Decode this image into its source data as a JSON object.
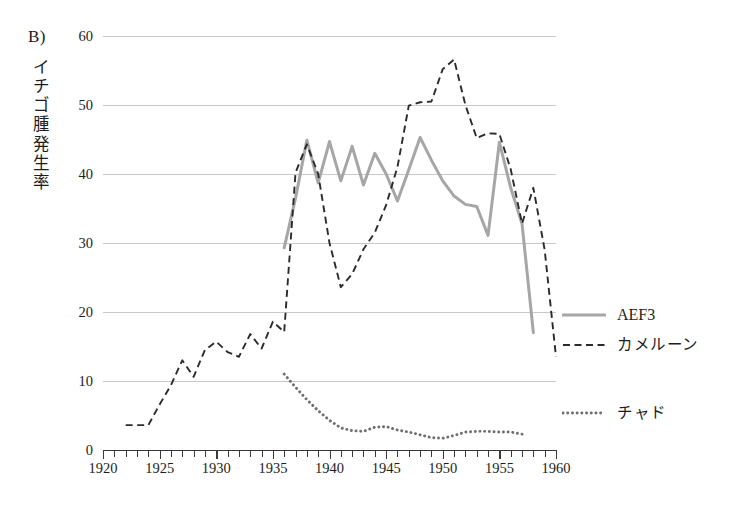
{
  "figure": {
    "panel_label": "B)",
    "y_axis_title": "イチゴ腫発生率",
    "y_axis_title_chars": [
      "イ",
      "チ",
      "ゴ",
      "腫",
      "発",
      "生",
      "率"
    ]
  },
  "axes": {
    "y_ticks": [
      "0",
      "10",
      "20",
      "30",
      "40",
      "50",
      "60"
    ],
    "x_ticks": [
      "1920",
      "1925",
      "1930",
      "1935",
      "1940",
      "1945",
      "1950",
      "1955",
      "1960"
    ]
  },
  "legend": {
    "position": "right",
    "entries": [
      {
        "label": "AEF3",
        "style": "solid",
        "color": "#a6a6a6"
      },
      {
        "label": "カメルーン",
        "style": "dashed",
        "color": "#2b2b2b"
      },
      {
        "label": "チャド",
        "style": "dotted",
        "color": "#6f6f6f"
      }
    ]
  },
  "chart_data": {
    "type": "line",
    "title": "B)",
    "xlabel": "",
    "ylabel": "イチゴ腫発生率",
    "xlim": [
      1920,
      1960
    ],
    "ylim": [
      0,
      60
    ],
    "grid": true,
    "legend_position": "right",
    "series": [
      {
        "name": "AEF3",
        "style": "solid",
        "color": "#a6a6a6",
        "x": [
          1936,
          1937,
          1938,
          1939,
          1940,
          1941,
          1942,
          1943,
          1944,
          1945,
          1946,
          1947,
          1948,
          1949,
          1950,
          1951,
          1952,
          1953,
          1954,
          1955,
          1956,
          1957,
          1958
        ],
        "y": [
          29.3,
          36.5,
          44.9,
          38.7,
          44.7,
          39.0,
          44.0,
          38.4,
          43.0,
          40.0,
          36.1,
          40.6,
          45.3,
          42.0,
          39.0,
          36.8,
          35.6,
          35.3,
          31.1,
          44.6,
          38.0,
          32.8,
          17.0
        ]
      },
      {
        "name": "カメルーン",
        "style": "dashed",
        "color": "#2b2b2b",
        "x": [
          1922,
          1923,
          1924,
          1925,
          1926,
          1927,
          1928,
          1929,
          1930,
          1931,
          1932,
          1933,
          1934,
          1935,
          1936,
          1937,
          1938,
          1939,
          1940,
          1941,
          1942,
          1943,
          1944,
          1945,
          1946,
          1947,
          1948,
          1949,
          1950,
          1951,
          1952,
          1953,
          1954,
          1955,
          1956,
          1957,
          1958,
          1959,
          1960
        ],
        "y": [
          3.6,
          3.6,
          3.6,
          6.6,
          9.4,
          13.0,
          10.6,
          14.5,
          15.7,
          14.2,
          13.5,
          16.8,
          14.7,
          18.6,
          17.1,
          40.2,
          44.3,
          40.0,
          30.0,
          23.6,
          25.5,
          29.1,
          31.5,
          35.5,
          41.0,
          49.9,
          50.4,
          50.5,
          55.2,
          56.6,
          50.0,
          45.2,
          45.9,
          45.8,
          40.7,
          32.8,
          38.0,
          29.0,
          13.5
        ]
      },
      {
        "name": "チャド",
        "style": "dotted",
        "color": "#6f6f6f",
        "x": [
          1936,
          1937,
          1938,
          1939,
          1940,
          1941,
          1942,
          1943,
          1944,
          1945,
          1946,
          1947,
          1948,
          1949,
          1950,
          1951,
          1952,
          1953,
          1954,
          1955,
          1956,
          1957
        ],
        "y": [
          11.0,
          9.1,
          7.3,
          5.7,
          4.3,
          3.2,
          2.8,
          2.7,
          3.3,
          3.4,
          2.9,
          2.6,
          2.2,
          1.8,
          1.7,
          2.1,
          2.6,
          2.7,
          2.7,
          2.6,
          2.6,
          2.3
        ]
      }
    ]
  }
}
